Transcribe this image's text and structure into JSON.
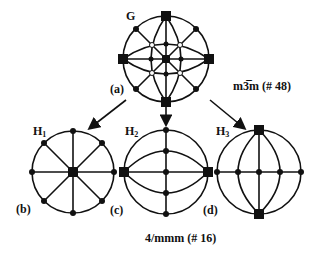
{
  "labels": {
    "G": "G",
    "a": "(a)",
    "b": "(b)",
    "c": "(c)",
    "d": "(d)",
    "H1": {
      "base": "H",
      "sub": "1"
    },
    "H2": {
      "base": "H",
      "sub": "2"
    },
    "H3": {
      "base": "H",
      "sub": "3"
    },
    "group_top": "m3̅m  (# 48)",
    "group_bottom": "4/mmm  (# 16)"
  },
  "colors": {
    "ink": "#111111",
    "background": "#ffffff"
  }
}
